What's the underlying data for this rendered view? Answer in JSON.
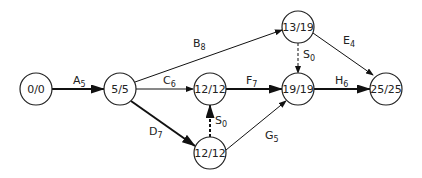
{
  "diagram": {
    "type": "activity-network",
    "nodes": [
      {
        "id": "n0",
        "label": "0/0",
        "x": 36,
        "y": 89
      },
      {
        "id": "n1",
        "label": "5/5",
        "x": 120,
        "y": 89
      },
      {
        "id": "n2",
        "label": "12/12",
        "x": 210,
        "y": 89
      },
      {
        "id": "n3",
        "label": "12/12",
        "x": 210,
        "y": 153
      },
      {
        "id": "n4",
        "label": "13/19",
        "x": 298,
        "y": 27
      },
      {
        "id": "n5",
        "label": "19/19",
        "x": 298,
        "y": 89
      },
      {
        "id": "n6",
        "label": "25/25",
        "x": 386,
        "y": 89
      }
    ],
    "edges": [
      {
        "id": "A",
        "letter": "A",
        "duration": "5",
        "from": "n0",
        "to": "n1",
        "critical": true,
        "dummy": false
      },
      {
        "id": "B",
        "letter": "B",
        "duration": "8",
        "from": "n1",
        "to": "n4",
        "critical": false,
        "dummy": false
      },
      {
        "id": "C",
        "letter": "C",
        "duration": "6",
        "from": "n1",
        "to": "n2",
        "critical": false,
        "dummy": false
      },
      {
        "id": "D",
        "letter": "D",
        "duration": "7",
        "from": "n1",
        "to": "n3",
        "critical": true,
        "dummy": false
      },
      {
        "id": "E",
        "letter": "E",
        "duration": "4",
        "from": "n4",
        "to": "n6",
        "critical": false,
        "dummy": false
      },
      {
        "id": "F",
        "letter": "F",
        "duration": "7",
        "from": "n2",
        "to": "n5",
        "critical": true,
        "dummy": false
      },
      {
        "id": "G",
        "letter": "G",
        "duration": "5",
        "from": "n3",
        "to": "n5",
        "critical": false,
        "dummy": false
      },
      {
        "id": "H",
        "letter": "H",
        "duration": "6",
        "from": "n5",
        "to": "n6",
        "critical": true,
        "dummy": false
      },
      {
        "id": "S_upper",
        "letter": "S",
        "duration": "0",
        "from": "n4",
        "to": "n5",
        "critical": false,
        "dummy": true
      },
      {
        "id": "S_lower",
        "letter": "S",
        "duration": "0",
        "from": "n3",
        "to": "n2",
        "critical": true,
        "dummy": true
      }
    ]
  }
}
